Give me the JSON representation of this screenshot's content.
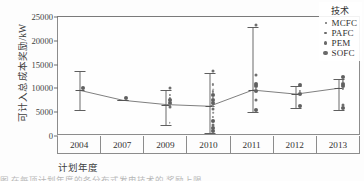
{
  "chart_data": {
    "type": "scatter",
    "title": "",
    "xlabel": "计划年度",
    "ylabel": "可计入总成本奖励/kW",
    "legend_title": "技术",
    "legend_position": "top-right",
    "grid": false,
    "ylim": [
      0,
      25000
    ],
    "yticks": [
      0,
      5000,
      10000,
      15000,
      20000,
      25000
    ],
    "ytick_labels": [
      "0",
      "5000",
      "10000",
      "15000",
      "20000",
      "25000"
    ],
    "categories": [
      "2004",
      "2007",
      "2009",
      "2010",
      "2011",
      "2012",
      "2013"
    ],
    "legend": [
      {
        "label": "MCFC",
        "marker": "dot",
        "size": 1
      },
      {
        "label": "PAFC",
        "marker": "dot",
        "size": 2
      },
      {
        "label": "PEM",
        "marker": "dot",
        "size": 3
      },
      {
        "label": "SOFC",
        "marker": "dot",
        "size": 4
      }
    ],
    "mean_values": [
      9600,
      7500,
      6600,
      6250,
      9650,
      8800,
      10050
    ],
    "error_bars": [
      {
        "category": "2004",
        "low": 5400,
        "high": 13700,
        "mean": 9600
      },
      {
        "category": "2007",
        "low": 7500,
        "high": 7500,
        "mean": 7500
      },
      {
        "category": "2009",
        "low": 2400,
        "high": 9600,
        "mean": 6600
      },
      {
        "category": "2010",
        "low": 600,
        "high": 13300,
        "mean": 6250
      },
      {
        "category": "2011",
        "low": 5100,
        "high": 22800,
        "mean": 9650
      },
      {
        "category": "2012",
        "low": 5800,
        "high": 10400,
        "mean": 8800
      },
      {
        "category": "2013",
        "low": 5400,
        "high": 12000,
        "mean": 10050
      }
    ],
    "points": [
      {
        "category": "2004",
        "series": "SOFC",
        "value": 9600
      },
      {
        "category": "2007",
        "series": "SOFC",
        "value": 7500
      },
      {
        "category": "2009",
        "series": "PEM",
        "value": 9600
      },
      {
        "category": "2009",
        "series": "PAFC",
        "value": 8200
      },
      {
        "category": "2009",
        "series": "PAFC",
        "value": 7600
      },
      {
        "category": "2009",
        "series": "SOFC",
        "value": 7100
      },
      {
        "category": "2009",
        "series": "SOFC",
        "value": 6600
      },
      {
        "category": "2009",
        "series": "PAFC",
        "value": 6100
      },
      {
        "category": "2009",
        "series": "PEM",
        "value": 5600
      },
      {
        "category": "2009",
        "series": "MCFC",
        "value": 2400
      },
      {
        "category": "2010",
        "series": "PEM",
        "value": 13300
      },
      {
        "category": "2010",
        "series": "PAFC",
        "value": 10400
      },
      {
        "category": "2010",
        "series": "MCFC",
        "value": 9400
      },
      {
        "category": "2010",
        "series": "PAFC",
        "value": 8900
      },
      {
        "category": "2010",
        "series": "SOFC",
        "value": 8300
      },
      {
        "category": "2010",
        "series": "PAFC",
        "value": 7700
      },
      {
        "category": "2010",
        "series": "SOFC",
        "value": 7100
      },
      {
        "category": "2010",
        "series": "SOFC",
        "value": 6500
      },
      {
        "category": "2010",
        "series": "PAFC",
        "value": 5900
      },
      {
        "category": "2010",
        "series": "PEM",
        "value": 5300
      },
      {
        "category": "2010",
        "series": "MCFC",
        "value": 4400
      },
      {
        "category": "2010",
        "series": "PAFC",
        "value": 3600
      },
      {
        "category": "2010",
        "series": "SOFC",
        "value": 2700
      },
      {
        "category": "2010",
        "series": "PEM",
        "value": 1900
      },
      {
        "category": "2010",
        "series": "SOFC",
        "value": 1200
      },
      {
        "category": "2010",
        "series": "SOFC",
        "value": 600
      },
      {
        "category": "2011",
        "series": "PEM",
        "value": 22800
      },
      {
        "category": "2011",
        "series": "PEM",
        "value": 12300
      },
      {
        "category": "2011",
        "series": "SOFC",
        "value": 10500
      },
      {
        "category": "2011",
        "series": "SOFC",
        "value": 10000
      },
      {
        "category": "2011",
        "series": "PAFC",
        "value": 9600
      },
      {
        "category": "2011",
        "series": "SOFC",
        "value": 9100
      },
      {
        "category": "2011",
        "series": "PEM",
        "value": 7200
      },
      {
        "category": "2011",
        "series": "SOFC",
        "value": 5100
      },
      {
        "category": "2012",
        "series": "SOFC",
        "value": 10400
      },
      {
        "category": "2012",
        "series": "PAFC",
        "value": 9000
      },
      {
        "category": "2012",
        "series": "SOFC",
        "value": 8400
      },
      {
        "category": "2012",
        "series": "SOFC",
        "value": 5800
      },
      {
        "category": "2013",
        "series": "SOFC",
        "value": 12000
      },
      {
        "category": "2013",
        "series": "PAFC",
        "value": 11200
      },
      {
        "category": "2013",
        "series": "SOFC",
        "value": 10600
      },
      {
        "category": "2013",
        "series": "SOFC",
        "value": 10000
      },
      {
        "category": "2013",
        "series": "PAFC",
        "value": 9400
      },
      {
        "category": "2013",
        "series": "PEM",
        "value": 6200
      },
      {
        "category": "2013",
        "series": "SOFC",
        "value": 5400
      }
    ]
  },
  "caption": "图          在每项计划年度的各分布式发电技术的  奖励上限"
}
